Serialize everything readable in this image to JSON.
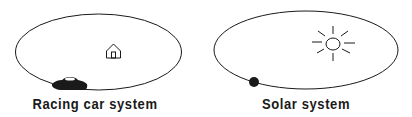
{
  "diagrams": [
    {
      "id": "racing",
      "label": "Racing car system",
      "center_object": "house-icon",
      "orbiting_object": "racing-car-icon"
    },
    {
      "id": "solar",
      "label": "Solar system",
      "center_object": "sun-icon",
      "orbiting_object": "planet-icon"
    }
  ],
  "colors": {
    "stroke": "#1a1a1a",
    "background": "#ffffff"
  }
}
